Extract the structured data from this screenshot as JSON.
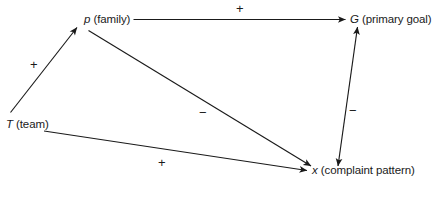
{
  "diagram": {
    "type": "signed-causal-path-diagram",
    "background_color": "#ffffff",
    "line_color": "#1a1a1a",
    "nodes": [
      {
        "id": "p",
        "symbol": "p",
        "description": "(family)",
        "label": "p (family)"
      },
      {
        "id": "G",
        "symbol": "G",
        "description": "(primary goal)",
        "label": "G (primary goal)"
      },
      {
        "id": "T",
        "symbol": "T",
        "description": "(team)",
        "label": "T (team)"
      },
      {
        "id": "x",
        "symbol": "x",
        "description": "(complaint pattern)",
        "label": "x (complaint pattern)"
      }
    ],
    "edges": [
      {
        "id": "t-p",
        "from": "T",
        "to": "p",
        "sign": "+",
        "arrows": "single"
      },
      {
        "id": "p-g",
        "from": "p",
        "to": "G",
        "sign": "+",
        "arrows": "single"
      },
      {
        "id": "p-x",
        "from": "p",
        "to": "x",
        "sign": "−",
        "arrows": "single"
      },
      {
        "id": "t-x",
        "from": "T",
        "to": "x",
        "sign": "+",
        "arrows": "single"
      },
      {
        "id": "g-x",
        "from": "x",
        "to": "G",
        "sign": "−",
        "arrows": "double"
      }
    ],
    "signs": {
      "p_to_g": "+",
      "t_to_p": "+",
      "p_to_x": "−",
      "g_to_x": "−",
      "t_to_x": "+"
    }
  }
}
